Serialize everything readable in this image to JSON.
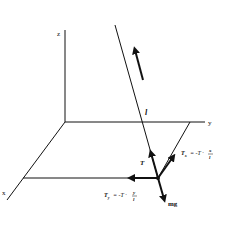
{
  "diagram": {
    "axes": {
      "z_label": "z",
      "y_label": "y",
      "x_label": "x"
    },
    "rope_length_label": "l",
    "tension_label": "T",
    "tx_label": {
      "lhs": "T",
      "lhs_sub": "x",
      "rhs": "= -T ·",
      "num": "x",
      "den": "l"
    },
    "ty_label": {
      "lhs": "T",
      "lhs_sub": "y",
      "rhs": "= -T ·",
      "num": "y",
      "den": "l"
    },
    "gravity_label": "mg",
    "colors": {
      "line": "#111111",
      "background": "#ffffff"
    }
  }
}
